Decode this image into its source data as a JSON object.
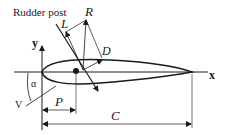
{
  "diagram": {
    "labels": {
      "rudder_post": "Rudder post",
      "R": "R",
      "L": "L",
      "D": "D",
      "y": "y",
      "x": "x",
      "alpha": "α",
      "V": "V",
      "P": "P",
      "C": "C"
    },
    "colors": {
      "stroke": "#1a1a1a",
      "background": "#ffffff"
    }
  }
}
